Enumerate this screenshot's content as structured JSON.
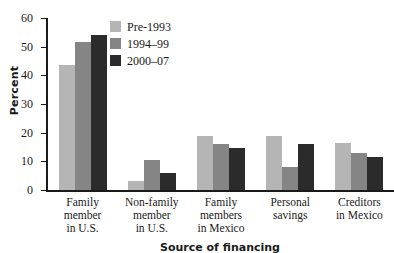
{
  "chart_data": {
    "type": "bar",
    "title": "",
    "xlabel": "Source of financing",
    "ylabel": "Percent",
    "ylim": [
      0,
      60
    ],
    "yticks": [
      0,
      10,
      20,
      30,
      40,
      50,
      60
    ],
    "grid": false,
    "legend_position": "top-center-inside",
    "categories": [
      "Family member in U.S.",
      "Non-family member in U.S.",
      "Family members in Mexico",
      "Personal savings",
      "Creditors in Mexico"
    ],
    "category_lines": [
      [
        "Family",
        "member",
        "in U.S."
      ],
      [
        "Non-family",
        "member",
        "in U.S."
      ],
      [
        "Family",
        "members",
        "in Mexico"
      ],
      [
        "Personal",
        "savings"
      ],
      [
        "Creditors",
        "in Mexico"
      ]
    ],
    "series": [
      {
        "name": "Pre-1993",
        "color": "#b5b5b5",
        "values": [
          43.5,
          3.0,
          19.0,
          19.0,
          16.5
        ]
      },
      {
        "name": "1994–99",
        "color": "#858585",
        "values": [
          51.5,
          10.5,
          16.0,
          8.0,
          13.0
        ]
      },
      {
        "name": "2000–07",
        "color": "#2b2b2b",
        "values": [
          54.0,
          6.0,
          14.5,
          16.0,
          11.5
        ]
      }
    ]
  }
}
